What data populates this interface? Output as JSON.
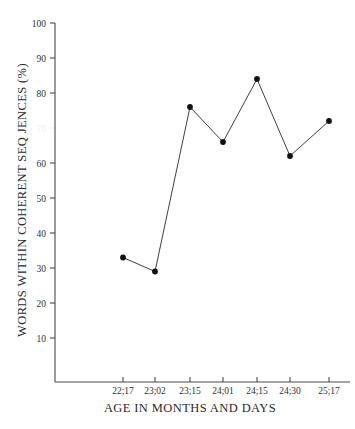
{
  "chart_data": {
    "type": "line",
    "title": "",
    "xlabel": "AGE IN MONTHS AND DAYS",
    "ylabel": "WORDS WITHIN COHERENT SEQ  JENCES (%)",
    "categories": [
      "22;17",
      "23;02",
      "23;15",
      "24;01",
      "24;15",
      "24;30",
      "25;17"
    ],
    "values": [
      33,
      29,
      76,
      66,
      84,
      62,
      72
    ],
    "series": [
      {
        "name": "words within coherent sequences",
        "values": [
          33,
          29,
          76,
          66,
          84,
          62,
          72
        ]
      }
    ],
    "ylim": [
      0,
      100
    ],
    "yticks": [
      10,
      20,
      30,
      40,
      50,
      60,
      70,
      80,
      90,
      100
    ],
    "ytick_labels": [
      "10",
      "20",
      "30",
      "40",
      "50",
      "60",
      "70",
      "80",
      "90",
      "100"
    ],
    "faded_ytick_labels": [
      "70"
    ],
    "xtick_labels": [
      "22;17",
      "23;02",
      "23;15",
      "24;01",
      "24;15",
      "24;30",
      "25;17"
    ],
    "grid": false,
    "legend": "none",
    "marker": "filled-circle",
    "line_color": "#2a2a2a",
    "marker_color": "#111111",
    "axis_color": "#4a4a4a",
    "background_color": "#ffffff"
  },
  "axes": {
    "y_axis_title": "WORDS WITHIN COHERENT SEQ  JENCES (%)",
    "x_axis_title": "AGE IN MONTHS AND DAYS"
  }
}
